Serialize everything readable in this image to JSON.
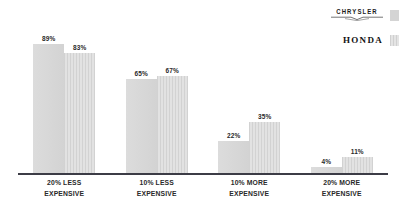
{
  "chart_data": {
    "type": "bar",
    "title": "",
    "subtitle": "",
    "xlabel": "",
    "ylabel": "",
    "ylim": [
      0,
      100
    ],
    "grid": false,
    "legend_position": "top-right",
    "categories": [
      "20% LESS EXPENSIVE",
      "10% LESS EXPENSIVE",
      "10% MORE EXPENSIVE",
      "20% MORE EXPENSIVE"
    ],
    "category_lines": [
      [
        "20% LESS",
        "EXPENSIVE"
      ],
      [
        "10% LESS",
        "EXPENSIVE"
      ],
      [
        "10% MORE",
        "EXPENSIVE"
      ],
      [
        "20% MORE",
        "EXPENSIVE"
      ]
    ],
    "series": [
      {
        "name": "CHRYSLER",
        "color": "#dadada",
        "fill": "flat",
        "values": [
          89,
          65,
          22,
          4
        ],
        "labels": [
          "89%",
          "65%",
          "22%",
          "4%"
        ]
      },
      {
        "name": "HONDA",
        "color": "#dcdcdc",
        "fill": "striped",
        "values": [
          83,
          67,
          35,
          11
        ],
        "labels": [
          "83%",
          "67%",
          "35%",
          "11%"
        ]
      }
    ]
  },
  "legend": {
    "items": [
      {
        "brand": "CHRYSLER",
        "swatch_style": "flat",
        "swatch_color": "#d4d4d4"
      },
      {
        "brand": "HONDA",
        "swatch_style": "striped",
        "swatch_color": "#dcdcdc"
      }
    ]
  },
  "colors": {
    "background": "#ffffff",
    "axis": "#3c3c46",
    "label_text": "#2a2a2a",
    "series_chrysler": "#dadada",
    "series_honda": "#dcdcdc"
  }
}
